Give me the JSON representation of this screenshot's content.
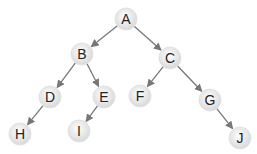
{
  "diagram": {
    "type": "binary-tree",
    "node_radius": 11,
    "colors": {
      "edge": "#777777",
      "node_fill_center": "#ffffff",
      "node_fill_edge": "#d8d8d8",
      "node_stroke": "#e2e2e2",
      "label": "#222222"
    },
    "nodes": [
      {
        "id": "A",
        "label": "A",
        "x": 126,
        "y": 19
      },
      {
        "id": "B",
        "label": "B",
        "x": 82,
        "y": 54
      },
      {
        "id": "C",
        "label": "C",
        "x": 170,
        "y": 58
      },
      {
        "id": "D",
        "label": "D",
        "x": 50,
        "y": 97
      },
      {
        "id": "E",
        "label": "E",
        "x": 104,
        "y": 97
      },
      {
        "id": "F",
        "label": "F",
        "x": 140,
        "y": 96
      },
      {
        "id": "G",
        "label": "G",
        "x": 210,
        "y": 100
      },
      {
        "id": "H",
        "label": "H",
        "x": 20,
        "y": 134
      },
      {
        "id": "I",
        "label": "I",
        "x": 79,
        "y": 131
      },
      {
        "id": "J",
        "label": "J",
        "x": 240,
        "y": 138
      }
    ],
    "edges": [
      {
        "from": "A",
        "to": "B"
      },
      {
        "from": "A",
        "to": "C"
      },
      {
        "from": "B",
        "to": "D"
      },
      {
        "from": "B",
        "to": "E"
      },
      {
        "from": "C",
        "to": "F"
      },
      {
        "from": "C",
        "to": "G"
      },
      {
        "from": "D",
        "to": "H"
      },
      {
        "from": "E",
        "to": "I"
      },
      {
        "from": "G",
        "to": "J"
      }
    ]
  }
}
